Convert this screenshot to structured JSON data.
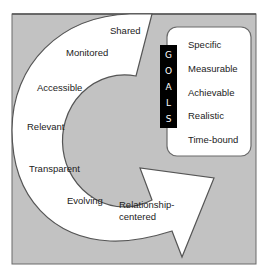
{
  "goals": {
    "title_letters": [
      "G",
      "O",
      "A",
      "L",
      "S"
    ],
    "smart_items": [
      "Specific",
      "Measurable",
      "Achievable",
      "Realistic",
      "Time-bound"
    ]
  },
  "arrow_items": [
    "Shared",
    "Monitored",
    "Accessible",
    "Relevant",
    "Transparent",
    "Evolving",
    "Relationship-",
    "centered"
  ],
  "colors": {
    "background_gray": "#c2c2c2",
    "outline": "#5a5a5a",
    "arrow_fill": "#ffffff",
    "goals_bar": "#000000"
  }
}
